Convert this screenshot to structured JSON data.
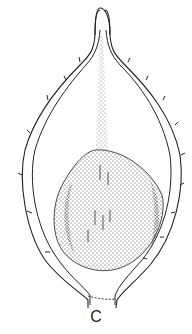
{
  "figure": {
    "panel_label": "C",
    "colors": {
      "line": "#222222",
      "stipple": "#333333",
      "background": "#ffffff"
    }
  }
}
